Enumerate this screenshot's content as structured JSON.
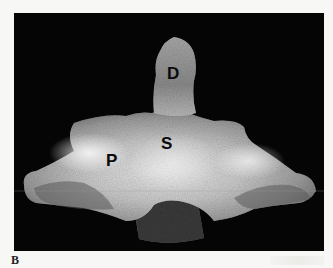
{
  "figure": {
    "panel_label": "B",
    "image_type": "radiograph",
    "background_color": "#050505",
    "page_color": "#f7f7f5",
    "labels": [
      {
        "text": "D",
        "x": 156,
        "y": 52
      },
      {
        "text": "S",
        "x": 148,
        "y": 131
      },
      {
        "text": "P",
        "x": 92,
        "y": 145
      }
    ]
  }
}
